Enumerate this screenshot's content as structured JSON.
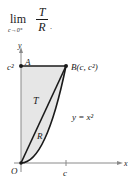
{
  "formula": {
    "lim": "lim",
    "subscript": "c→0⁺",
    "numerator": "T",
    "denominator": "R",
    "trailing": "."
  },
  "diagram": {
    "y_axis_label": "y",
    "x_axis_label": "x",
    "origin_label": "O",
    "point_a_label": "A",
    "point_b_label": "B(c, c²)",
    "y_tick_label": "c²",
    "x_tick_label": "c",
    "region_t_label": "T",
    "region_r_label": "R",
    "curve_label": "y = x²",
    "colors": {
      "shade": "#e6e6e6",
      "axis": "#8a8a8a",
      "line": "#1a1a1a"
    }
  }
}
